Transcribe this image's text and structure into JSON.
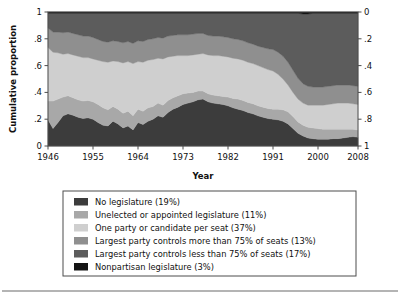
{
  "figure": {
    "background": "#ffffff",
    "frame_color": "#4d4d4d",
    "divider_color": "#6b6b6b"
  },
  "chart_data": {
    "type": "area",
    "title": "",
    "xlabel": "Year",
    "ylabel": "Cumulative proportion",
    "xlim": [
      1946,
      2008
    ],
    "ylim": [
      0,
      1
    ],
    "grid": false,
    "legend_position": "below",
    "left_axis": {
      "label": "Cumulative proportion",
      "ticks": [
        0,
        0.2,
        0.4,
        0.6,
        0.8,
        1
      ],
      "tick_labels": [
        "0",
        ".2",
        ".4",
        ".6",
        ".8",
        "1"
      ],
      "reversed": false
    },
    "right_axis": {
      "label": "",
      "ticks": [
        0,
        0.2,
        0.4,
        0.6,
        0.8,
        1
      ],
      "tick_labels": [
        "0",
        ".2",
        ".4",
        ".6",
        ".8",
        "1"
      ],
      "reversed": true
    },
    "x_ticks": [
      1946,
      1955,
      1964,
      1973,
      1982,
      1991,
      2000,
      2008
    ],
    "x_tick_labels": [
      "1946",
      "1955",
      "1964",
      "1973",
      "1982",
      "1991",
      "2000",
      "2008"
    ],
    "x": [
      1946,
      1947,
      1948,
      1949,
      1950,
      1951,
      1952,
      1953,
      1954,
      1955,
      1956,
      1957,
      1958,
      1959,
      1960,
      1961,
      1962,
      1963,
      1964,
      1965,
      1966,
      1967,
      1968,
      1969,
      1970,
      1971,
      1972,
      1973,
      1974,
      1975,
      1976,
      1977,
      1978,
      1979,
      1980,
      1981,
      1982,
      1983,
      1984,
      1985,
      1986,
      1987,
      1988,
      1989,
      1990,
      1991,
      1992,
      1993,
      1994,
      1995,
      1996,
      1997,
      1998,
      1999,
      2000,
      2001,
      2002,
      2003,
      2004,
      2005,
      2006,
      2007,
      2008
    ],
    "stack_order": [
      "no_legislature",
      "unelected_or_appointed",
      "one_party_per_seat",
      "largest_party_more_75",
      "largest_party_less_75",
      "nonpartisan"
    ],
    "series": [
      {
        "name": "No legislature (19%)",
        "key": "no_legislature",
        "color": "#3c3c3c",
        "share": 19,
        "values": [
          0.195,
          0.13,
          0.175,
          0.225,
          0.24,
          0.23,
          0.215,
          0.205,
          0.21,
          0.2,
          0.175,
          0.155,
          0.15,
          0.185,
          0.165,
          0.135,
          0.15,
          0.12,
          0.175,
          0.16,
          0.185,
          0.2,
          0.225,
          0.215,
          0.25,
          0.275,
          0.29,
          0.31,
          0.32,
          0.33,
          0.345,
          0.35,
          0.33,
          0.32,
          0.315,
          0.31,
          0.3,
          0.285,
          0.275,
          0.265,
          0.25,
          0.24,
          0.225,
          0.215,
          0.205,
          0.2,
          0.195,
          0.185,
          0.165,
          0.13,
          0.095,
          0.075,
          0.06,
          0.055,
          0.05,
          0.05,
          0.05,
          0.055,
          0.055,
          0.06,
          0.065,
          0.07,
          0.065
        ]
      },
      {
        "name": "Unelected or appointed legislature (11%)",
        "key": "unelected_or_appointed",
        "color": "#a8a8a8",
        "share": 11,
        "values": [
          0.14,
          0.205,
          0.175,
          0.14,
          0.135,
          0.13,
          0.13,
          0.13,
          0.13,
          0.13,
          0.135,
          0.13,
          0.12,
          0.11,
          0.11,
          0.11,
          0.11,
          0.105,
          0.1,
          0.1,
          0.1,
          0.095,
          0.095,
          0.09,
          0.09,
          0.085,
          0.085,
          0.08,
          0.075,
          0.07,
          0.065,
          0.06,
          0.06,
          0.06,
          0.06,
          0.06,
          0.065,
          0.07,
          0.075,
          0.075,
          0.075,
          0.075,
          0.075,
          0.075,
          0.075,
          0.075,
          0.08,
          0.085,
          0.09,
          0.09,
          0.085,
          0.08,
          0.08,
          0.08,
          0.08,
          0.075,
          0.075,
          0.07,
          0.07,
          0.065,
          0.06,
          0.055,
          0.055
        ]
      },
      {
        "name": "One party or candidate per seat (37%)",
        "key": "one_party_per_seat",
        "color": "#cfcfcf",
        "share": 37,
        "values": [
          0.4,
          0.365,
          0.345,
          0.32,
          0.315,
          0.32,
          0.325,
          0.325,
          0.32,
          0.32,
          0.33,
          0.345,
          0.355,
          0.34,
          0.355,
          0.375,
          0.37,
          0.39,
          0.355,
          0.365,
          0.355,
          0.35,
          0.335,
          0.345,
          0.325,
          0.31,
          0.3,
          0.285,
          0.28,
          0.28,
          0.275,
          0.28,
          0.29,
          0.295,
          0.3,
          0.3,
          0.3,
          0.3,
          0.3,
          0.3,
          0.3,
          0.3,
          0.3,
          0.295,
          0.29,
          0.285,
          0.26,
          0.23,
          0.2,
          0.18,
          0.17,
          0.165,
          0.165,
          0.17,
          0.175,
          0.18,
          0.185,
          0.19,
          0.195,
          0.195,
          0.195,
          0.19,
          0.19
        ]
      },
      {
        "name": "Largest party controls more than 75% of seats (13%)",
        "key": "largest_party_more_75",
        "color": "#8f8f8f",
        "share": 13,
        "values": [
          0.145,
          0.15,
          0.155,
          0.16,
          0.16,
          0.16,
          0.16,
          0.16,
          0.16,
          0.16,
          0.155,
          0.15,
          0.15,
          0.15,
          0.15,
          0.15,
          0.15,
          0.15,
          0.155,
          0.155,
          0.155,
          0.155,
          0.155,
          0.155,
          0.155,
          0.155,
          0.155,
          0.155,
          0.155,
          0.155,
          0.155,
          0.15,
          0.145,
          0.145,
          0.145,
          0.145,
          0.145,
          0.145,
          0.145,
          0.145,
          0.145,
          0.145,
          0.145,
          0.15,
          0.155,
          0.16,
          0.165,
          0.17,
          0.17,
          0.165,
          0.155,
          0.145,
          0.14,
          0.135,
          0.135,
          0.135,
          0.135,
          0.135,
          0.135,
          0.135,
          0.135,
          0.135,
          0.135
        ]
      },
      {
        "name": "Largest party controls less than 75% of seats (17%)",
        "key": "largest_party_less_75",
        "color": "#5c5c5c",
        "share": 17,
        "values": [
          0.11,
          0.14,
          0.14,
          0.145,
          0.14,
          0.15,
          0.16,
          0.17,
          0.17,
          0.18,
          0.195,
          0.21,
          0.215,
          0.205,
          0.21,
          0.22,
          0.21,
          0.225,
          0.205,
          0.21,
          0.195,
          0.19,
          0.18,
          0.185,
          0.17,
          0.165,
          0.16,
          0.16,
          0.16,
          0.155,
          0.15,
          0.15,
          0.165,
          0.17,
          0.17,
          0.175,
          0.18,
          0.19,
          0.195,
          0.205,
          0.22,
          0.23,
          0.245,
          0.255,
          0.265,
          0.27,
          0.29,
          0.32,
          0.365,
          0.425,
          0.485,
          0.52,
          0.54,
          0.55,
          0.55,
          0.55,
          0.545,
          0.54,
          0.535,
          0.535,
          0.535,
          0.54,
          0.545
        ]
      },
      {
        "name": "Nonpartisan legislature (3%)",
        "key": "nonpartisan",
        "color": "#141414",
        "share": 3,
        "values": [
          0.01,
          0.01,
          0.01,
          0.01,
          0.01,
          0.01,
          0.01,
          0.01,
          0.01,
          0.01,
          0.01,
          0.01,
          0.01,
          0.01,
          0.01,
          0.01,
          0.01,
          0.01,
          0.01,
          0.01,
          0.01,
          0.01,
          0.01,
          0.01,
          0.01,
          0.01,
          0.01,
          0.01,
          0.01,
          0.01,
          0.01,
          0.01,
          0.01,
          0.01,
          0.01,
          0.01,
          0.01,
          0.01,
          0.01,
          0.01,
          0.01,
          0.01,
          0.01,
          0.01,
          0.01,
          0.01,
          0.01,
          0.01,
          0.01,
          0.01,
          0.01,
          0.015,
          0.015,
          0.01,
          0.01,
          0.01,
          0.01,
          0.01,
          0.01,
          0.01,
          0.01,
          0.01,
          0.01
        ]
      }
    ]
  },
  "legend": {
    "items": [
      {
        "label": "No legislature (19%)",
        "color": "#3c3c3c"
      },
      {
        "label": "Unelected or appointed legislature (11%)",
        "color": "#a8a8a8"
      },
      {
        "label": "One party or candidate per seat (37%)",
        "color": "#cfcfcf"
      },
      {
        "label": "Largest party controls more than 75% of seats (13%)",
        "color": "#8f8f8f"
      },
      {
        "label": "Largest party controls less than 75% of seats (17%)",
        "color": "#5c5c5c"
      },
      {
        "label": "Nonpartisan legislature (3%)",
        "color": "#141414"
      }
    ]
  }
}
